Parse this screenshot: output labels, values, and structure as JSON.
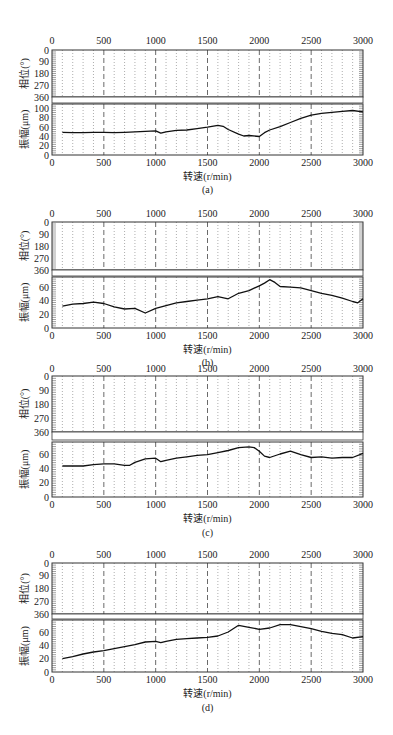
{
  "figure": {
    "x_axis_label": "转速(r/min)",
    "phase_label": "相位(°)",
    "amp_label": "振幅(μm)",
    "x_ticks": [
      0,
      500,
      1000,
      1500,
      2000,
      2500,
      3000
    ],
    "phase_ticks": [
      0,
      90,
      180,
      270,
      360
    ]
  },
  "chart_data": [
    {
      "type": "line",
      "caption": "(a)",
      "xlabel": "转速(r/min)",
      "ylabel_top": "相位(°)",
      "ylabel_bottom": "振幅(μm)",
      "xlim": [
        0,
        3000
      ],
      "phase_ylim": [
        0,
        360
      ],
      "phase_ticks": [
        0,
        90,
        180,
        270,
        360
      ],
      "amp_ylim": [
        0,
        110
      ],
      "amp_ticks": [
        0,
        20,
        40,
        60,
        80,
        100
      ],
      "grid": "dotted every 100 r/min, dashed every 500 r/min",
      "series": [
        {
          "name": "振幅",
          "x": [
            100,
            200,
            300,
            400,
            500,
            600,
            700,
            800,
            900,
            1000,
            1050,
            1100,
            1200,
            1300,
            1400,
            1500,
            1600,
            1650,
            1700,
            1800,
            1850,
            1900,
            2000,
            2050,
            2100,
            2200,
            2300,
            2400,
            2500,
            2600,
            2700,
            2800,
            2900,
            3000
          ],
          "y": [
            49,
            48,
            48,
            49,
            49,
            48,
            49,
            50,
            51,
            52,
            47,
            50,
            53,
            54,
            57,
            60,
            64,
            62,
            55,
            45,
            41,
            42,
            40,
            48,
            54,
            61,
            70,
            79,
            86,
            90,
            92,
            94,
            96,
            93
          ]
        }
      ]
    },
    {
      "type": "line",
      "caption": "(b)",
      "xlabel": "转速(r/min)",
      "ylabel_top": "相位(°)",
      "ylabel_bottom": "振幅(μm)",
      "xlim": [
        0,
        3000
      ],
      "phase_ylim": [
        0,
        360
      ],
      "phase_ticks": [
        0,
        90,
        180,
        270,
        360
      ],
      "amp_ylim": [
        0,
        75
      ],
      "amp_ticks": [
        0,
        20,
        40,
        60
      ],
      "grid": "dotted every 100 r/min, dashed every 500 r/min",
      "series": [
        {
          "name": "振幅",
          "x": [
            100,
            200,
            300,
            400,
            500,
            600,
            700,
            800,
            900,
            1000,
            1100,
            1200,
            1300,
            1400,
            1500,
            1600,
            1700,
            1800,
            1900,
            2000,
            2050,
            2100,
            2150,
            2200,
            2300,
            2400,
            2500,
            2600,
            2700,
            2800,
            2900,
            2950,
            3000
          ],
          "y": [
            32,
            35,
            36,
            38,
            36,
            31,
            28,
            29,
            22,
            29,
            33,
            37,
            39,
            41,
            43,
            46,
            43,
            51,
            55,
            62,
            66,
            71,
            67,
            61,
            60,
            59,
            55,
            51,
            48,
            44,
            39,
            37,
            43
          ]
        }
      ]
    },
    {
      "type": "line",
      "caption": "(c)",
      "xlabel": "转速(r/min)",
      "ylabel_top": "相位(°)",
      "ylabel_bottom": "振幅(μm)",
      "xlim": [
        0,
        3000
      ],
      "phase_ylim": [
        0,
        360
      ],
      "phase_ticks": [
        0,
        90,
        180,
        270,
        360
      ],
      "amp_ylim": [
        0,
        78
      ],
      "amp_ticks": [
        0,
        20,
        40,
        60
      ],
      "grid": "dotted every 100 r/min, dashed every 500 r/min",
      "series": [
        {
          "name": "振幅",
          "x": [
            100,
            200,
            300,
            400,
            500,
            600,
            700,
            750,
            800,
            900,
            1000,
            1050,
            1100,
            1200,
            1300,
            1400,
            1500,
            1600,
            1700,
            1800,
            1900,
            1950,
            2000,
            2050,
            2100,
            2200,
            2300,
            2400,
            2500,
            2600,
            2700,
            2800,
            2900,
            3000
          ],
          "y": [
            44,
            44,
            44,
            46,
            47,
            47,
            45,
            45,
            49,
            54,
            55,
            50,
            52,
            55,
            57,
            59,
            60,
            63,
            66,
            70,
            71,
            70,
            65,
            58,
            56,
            61,
            65,
            60,
            56,
            57,
            55,
            56,
            56,
            62
          ]
        }
      ]
    },
    {
      "type": "line",
      "caption": "(d)",
      "xlabel": "转速(r/min)",
      "ylabel_top": "相位(°)",
      "ylabel_bottom": "振幅(μm)",
      "xlim": [
        0,
        3000
      ],
      "phase_ylim": [
        0,
        360
      ],
      "phase_ticks": [
        0,
        90,
        180,
        270,
        360
      ],
      "amp_ylim": [
        0,
        78
      ],
      "amp_ticks": [
        0,
        20,
        40,
        60
      ],
      "grid": "dotted every 100 r/min, dashed every 500 r/min",
      "series": [
        {
          "name": "振幅",
          "x": [
            100,
            200,
            300,
            400,
            500,
            600,
            700,
            800,
            900,
            1000,
            1050,
            1100,
            1200,
            1300,
            1400,
            1500,
            1600,
            1700,
            1800,
            1900,
            2000,
            2100,
            2200,
            2300,
            2400,
            2500,
            2600,
            2700,
            2800,
            2900,
            3000
          ],
          "y": [
            20,
            23,
            27,
            30,
            32,
            35,
            38,
            41,
            45,
            46,
            44,
            46,
            49,
            50,
            51,
            52,
            54,
            60,
            70,
            67,
            64,
            66,
            71,
            71,
            68,
            65,
            61,
            58,
            56,
            51,
            53
          ]
        }
      ]
    }
  ]
}
